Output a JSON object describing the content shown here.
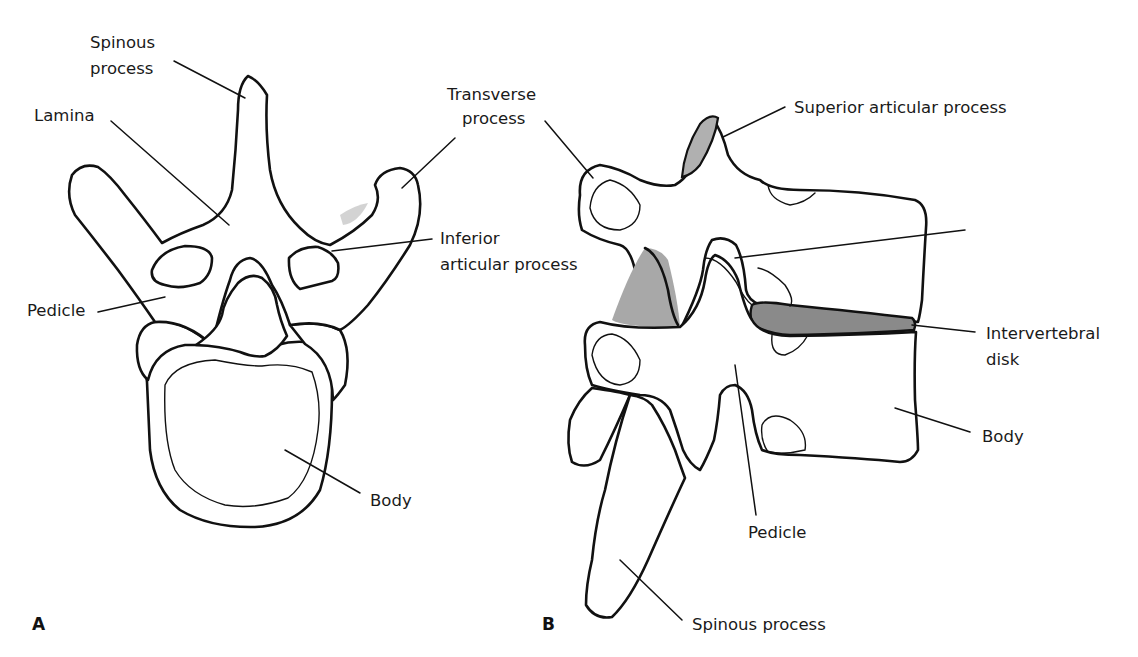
{
  "figure": {
    "panel_a": {
      "letter": "A",
      "view": "superior view of lumbar vertebra",
      "labels": {
        "spinous_process_line1": "Spinous",
        "spinous_process_line2": "process",
        "lamina": "Lamina",
        "transverse_process_line1": "Transverse",
        "transverse_process_line2": "process",
        "inferior_articular_line1": "Inferior",
        "inferior_articular_line2": "articular process",
        "pedicle": "Pedicle",
        "body": "Body"
      }
    },
    "panel_b": {
      "letter": "B",
      "view": "lateral view of two lumbar vertebrae",
      "labels": {
        "superior_articular": "Superior articular process",
        "intervertebral_line1": "Intervertebral",
        "intervertebral_line2": "disk",
        "body": "Body",
        "pedicle": "Pedicle",
        "spinous_process": "Spinous process"
      }
    },
    "colors": {
      "outline": "#111111",
      "shading": "#c4c4c4",
      "disk": "#8a8a8a",
      "background": "#ffffff"
    }
  }
}
